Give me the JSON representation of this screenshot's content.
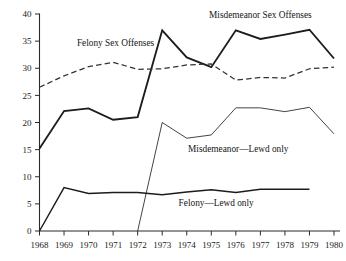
{
  "chart_data": {
    "type": "line",
    "title": "",
    "xlabel": "",
    "ylabel": "",
    "xlim": [
      1968,
      1980
    ],
    "ylim": [
      0,
      40
    ],
    "grid": false,
    "legend_position": "inline-annotations",
    "x": [
      1968,
      1969,
      1970,
      1971,
      1972,
      1973,
      1974,
      1975,
      1976,
      1977,
      1978,
      1979,
      1980
    ],
    "yticks": [
      0,
      5,
      10,
      15,
      20,
      25,
      30,
      35,
      40
    ],
    "ytick_labels": [
      "0",
      "5",
      "10",
      "15",
      "20",
      "25",
      "30",
      "35",
      "40"
    ],
    "xtick_labels": [
      "1968",
      "1969",
      "1970",
      "1971",
      "1972",
      "1973",
      "1974",
      "1975",
      "1976",
      "1977",
      "1978",
      "1979",
      "1980"
    ],
    "series": [
      {
        "name": "Misdemeanor Sex Offenses",
        "style": "solid-thick",
        "label": "Misdemeanor Sex Offenses",
        "label_x": 1977.0,
        "label_y": 39.2,
        "values": [
          15.2,
          22.1,
          22.6,
          20.5,
          21.0,
          37.0,
          32.0,
          30.2,
          37.0,
          35.4,
          36.2,
          37.1,
          31.8
        ]
      },
      {
        "name": "Felony Sex Offenses",
        "style": "dashed",
        "label": "Felony Sex Offenses",
        "label_x": 1971.1,
        "label_y": 34.1,
        "values": [
          26.5,
          28.6,
          30.3,
          31.1,
          29.8,
          29.9,
          30.6,
          30.8,
          27.8,
          28.3,
          28.2,
          29.9,
          30.2
        ]
      },
      {
        "name": "Misdemeanor—Lewd only",
        "style": "solid-thin",
        "label": "Misdemeanor—Lewd only",
        "label_x": 1976.1,
        "label_y": 14.6,
        "values": [
          null,
          null,
          null,
          null,
          0.0,
          20.0,
          17.1,
          17.7,
          22.7,
          22.7,
          22.0,
          22.8,
          17.9
        ]
      },
      {
        "name": "Felony—Lewd only",
        "style": "solid-medium",
        "label": "Felony—Lewd only",
        "label_x": 1975.2,
        "label_y": 4.6,
        "values": [
          0.0,
          8.0,
          6.9,
          7.1,
          7.1,
          6.7,
          7.2,
          7.6,
          7.1,
          7.7,
          7.7,
          7.7,
          null
        ]
      }
    ]
  },
  "colors": {
    "axis": "#2b2b2b",
    "text": "#1a1a1a",
    "series_solid": "#1c1c1c",
    "series_dashed": "#333333",
    "series_thin": "#3a3a3a",
    "background": "#ffffff"
  }
}
